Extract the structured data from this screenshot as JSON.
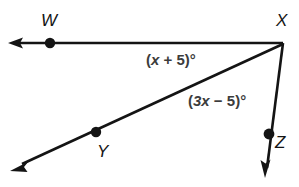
{
  "figure": {
    "type": "geometry-diagram",
    "background_color": "#ffffff",
    "stroke_color": "#141414",
    "label_color": "#141414",
    "angle_label_color": "#3c3c3c",
    "points": [
      {
        "name": "W",
        "label": "W",
        "x": 50,
        "y": 43,
        "dot": true
      },
      {
        "name": "X",
        "label": "X",
        "x": 283,
        "y": 43,
        "dot": false
      },
      {
        "name": "Y",
        "label": "Y",
        "x": 96,
        "y": 132,
        "dot": true
      },
      {
        "name": "Z",
        "label": "Z",
        "x": 269,
        "y": 134,
        "dot": true
      }
    ],
    "rays": [
      {
        "name": "ray-XW",
        "from": "X",
        "through": "W",
        "tip_x": 9,
        "tip_y": 43,
        "arrow": true
      },
      {
        "name": "ray-XY",
        "from": "X",
        "through": "Y",
        "tip_x": 11,
        "tip_y": 171,
        "arrow": true
      },
      {
        "name": "ray-XZ",
        "from": "X",
        "through": "Z",
        "tip_x": 265,
        "tip_y": 178,
        "arrow": true
      }
    ],
    "angles": [
      {
        "name": "angle-WXY",
        "prefix": "(",
        "variable": "x",
        "operator": " + ",
        "constant": "5",
        "suffix": ")°",
        "full_text": "(x + 5)°"
      },
      {
        "name": "angle-YXZ",
        "prefix": "(",
        "variable": "3x",
        "operator": " − ",
        "constant": "5",
        "suffix": ")°",
        "full_text": "(3x − 5)°"
      }
    ]
  }
}
